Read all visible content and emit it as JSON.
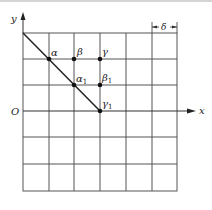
{
  "diagram": {
    "axes": {
      "x_label": "x",
      "y_label": "y",
      "origin_label": "O"
    },
    "dimension_label": "δ",
    "points": [
      {
        "name": "alpha",
        "label": "α",
        "sub": "",
        "x": 49,
        "y": 59
      },
      {
        "name": "beta",
        "label": "β",
        "sub": "",
        "x": 74,
        "y": 59
      },
      {
        "name": "gamma",
        "label": "γ",
        "sub": "",
        "x": 100,
        "y": 59
      },
      {
        "name": "alpha1",
        "label": "α",
        "sub": "1",
        "x": 74,
        "y": 85
      },
      {
        "name": "beta1",
        "label": "β",
        "sub": "1",
        "x": 100,
        "y": 85
      },
      {
        "name": "gamma1",
        "label": "γ",
        "sub": "1",
        "x": 100,
        "y": 111
      }
    ],
    "colors": {
      "line": "#333333",
      "grid": "#555555",
      "border": "#999999"
    }
  }
}
